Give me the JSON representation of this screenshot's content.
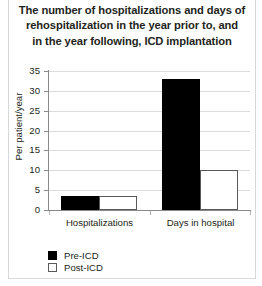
{
  "chart_data": {
    "type": "bar",
    "title": "The number of hospitalizations and days of rehospitalization in the year prior to, and in the year following, ICD implantation",
    "title_lines": [
      "The number of hospitalizations and days of",
      "rehospitalization in the year prior to, and",
      "in the year following, ICD implantation"
    ],
    "xlabel": "",
    "ylabel": "Per patient/year",
    "categories": [
      "Hospitalizations",
      "Days in hospital"
    ],
    "series": [
      {
        "name": "Pre-ICD",
        "values": [
          3.5,
          33
        ],
        "color": "#000000"
      },
      {
        "name": "Post-ICD",
        "values": [
          3.5,
          10
        ],
        "color": "#ffffff"
      }
    ],
    "ylim": [
      0,
      35
    ],
    "yticks": [
      0,
      5,
      10,
      15,
      20,
      25,
      30,
      35
    ],
    "ytick_labels": [
      "0",
      "5",
      "10",
      "15",
      "20",
      "25",
      "30",
      "35"
    ],
    "grid": "horizontal",
    "legend_position": "bottom-left",
    "legend": [
      {
        "label": "Pre-ICD",
        "swatch": "filled-black-square"
      },
      {
        "label": "Post-ICD",
        "swatch": "outlined-white-square"
      }
    ]
  }
}
